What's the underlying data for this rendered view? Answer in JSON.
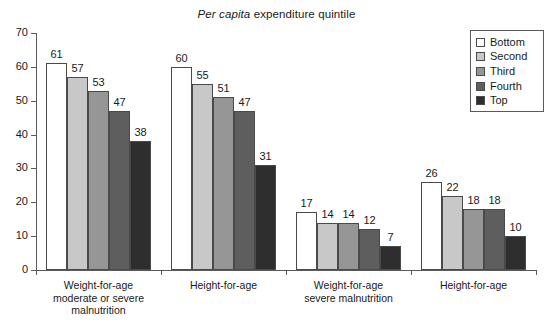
{
  "chart_data": {
    "type": "bar",
    "title_italic_part": "Per capita",
    "title_regular_part": "expenditure quintile",
    "xlabel": "",
    "ylabel": "",
    "ylim": [
      0,
      70
    ],
    "yticks": [
      0,
      10,
      20,
      30,
      40,
      50,
      60,
      70
    ],
    "grid": false,
    "legend_position": "top-right",
    "categories": [
      "Weight-for-age\nmoderate or severe\nmalnutrition",
      "Height-for-age",
      "Weight-for-age\nsevere malnutrition",
      "Height-for-age"
    ],
    "series": [
      {
        "name": "Bottom",
        "color": "#ffffff",
        "values": [
          61,
          60,
          17,
          26
        ]
      },
      {
        "name": "Second",
        "color": "#c8c8c8",
        "values": [
          57,
          55,
          14,
          22
        ]
      },
      {
        "name": "Third",
        "color": "#969696",
        "values": [
          53,
          51,
          14,
          18
        ]
      },
      {
        "name": "Fourth",
        "color": "#5e5e5e",
        "values": [
          47,
          47,
          12,
          18
        ]
      },
      {
        "name": "Top",
        "color": "#2e2e2e",
        "values": [
          38,
          31,
          7,
          10
        ]
      }
    ]
  },
  "axis": {
    "y_tick_labels": [
      "70",
      "60",
      "50",
      "40",
      "30",
      "20",
      "10",
      "0"
    ]
  },
  "legend": {
    "items": [
      {
        "label": "Bottom",
        "color": "#ffffff"
      },
      {
        "label": "Second",
        "color": "#c8c8c8"
      },
      {
        "label": "Third",
        "color": "#969696"
      },
      {
        "label": "Fourth",
        "color": "#5e5e5e"
      },
      {
        "label": "Top",
        "color": "#2e2e2e"
      }
    ]
  },
  "groups": [
    {
      "label": "Weight-for-age\nmoderate or severe\nmalnutrition"
    },
    {
      "label": "Height-for-age"
    },
    {
      "label": "Weight-for-age\nsevere malnutrition"
    },
    {
      "label": "Height-for-age"
    }
  ]
}
